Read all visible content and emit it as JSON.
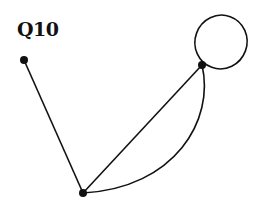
{
  "title": "Q10",
  "graph": {
    "stroke_color": "#111111",
    "vertices": [
      {
        "id": "A",
        "label": ""
      },
      {
        "id": "B",
        "label": ""
      },
      {
        "id": "C",
        "label": ""
      }
    ],
    "edges": [
      {
        "from": "A",
        "to": "C",
        "kind": "straight"
      },
      {
        "from": "B",
        "to": "C",
        "kind": "straight"
      },
      {
        "from": "B",
        "to": "C",
        "kind": "curved"
      },
      {
        "from": "B",
        "to": "B",
        "kind": "loop"
      }
    ]
  }
}
